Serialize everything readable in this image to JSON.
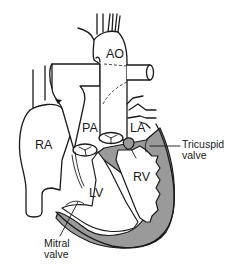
{
  "figure": {
    "type": "heart-anatomy-line-drawing",
    "colors": {
      "line": "#1a1a1a",
      "myocardium_fill": "#9a9a9a",
      "background": "#ffffff"
    },
    "labels": {
      "ao": "AO",
      "pa": "PA",
      "la": "LA",
      "ra": "RA",
      "lv": "LV",
      "rv": "RV",
      "tricuspid_line1": "Tricuspid",
      "tricuspid_line2": "valve",
      "mitral_line1": "Mitral",
      "mitral_line2": "valve"
    }
  }
}
